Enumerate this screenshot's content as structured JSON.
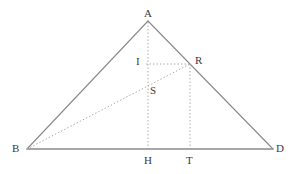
{
  "figure": {
    "kind": "geometry-diagram",
    "width": 295,
    "height": 174,
    "background": "#ffffff",
    "stroke_solid": "#8a8a8a",
    "stroke_dotted": "#a8a8a8",
    "label_color": "#3b3b3b",
    "points": {
      "A": {
        "label": "A",
        "x": 148,
        "y": 21,
        "label_x": 144,
        "label_y": 8
      },
      "B": {
        "label": "B",
        "x": 27,
        "y": 149,
        "label_x": 12,
        "label_y": 143
      },
      "D": {
        "label": "D",
        "x": 273,
        "y": 149,
        "label_x": 276,
        "label_y": 143
      },
      "R": {
        "label": "R",
        "x": 190,
        "y": 64,
        "label_x": 195,
        "label_y": 55
      },
      "I": {
        "label": "I",
        "x": 148,
        "y": 64,
        "label_x": 136,
        "label_y": 56
      },
      "S": {
        "label": "S",
        "x": 148,
        "y": 93,
        "label_x": 150,
        "label_y": 85
      },
      "H": {
        "label": "H",
        "x": 148,
        "y": 149,
        "label_x": 144,
        "label_y": 155
      },
      "T": {
        "label": "T",
        "x": 190,
        "y": 149,
        "label_x": 186,
        "label_y": 155
      }
    },
    "segments": [
      {
        "name": "side-AB",
        "from": "A",
        "to": "B",
        "style": "solid"
      },
      {
        "name": "side-AD",
        "from": "A",
        "to": "D",
        "style": "solid"
      },
      {
        "name": "base-BD",
        "from": "B",
        "to": "D",
        "style": "solid"
      },
      {
        "name": "altitude-AH",
        "from": "A",
        "to": "H",
        "style": "dotted"
      },
      {
        "name": "perpendicular-RT",
        "from": "R",
        "to": "T",
        "style": "dotted"
      },
      {
        "name": "horizontal-IR",
        "from": "I",
        "to": "R",
        "style": "dotted"
      },
      {
        "name": "cevian-BR",
        "from": "B",
        "to": "R",
        "style": "dotted"
      }
    ]
  }
}
